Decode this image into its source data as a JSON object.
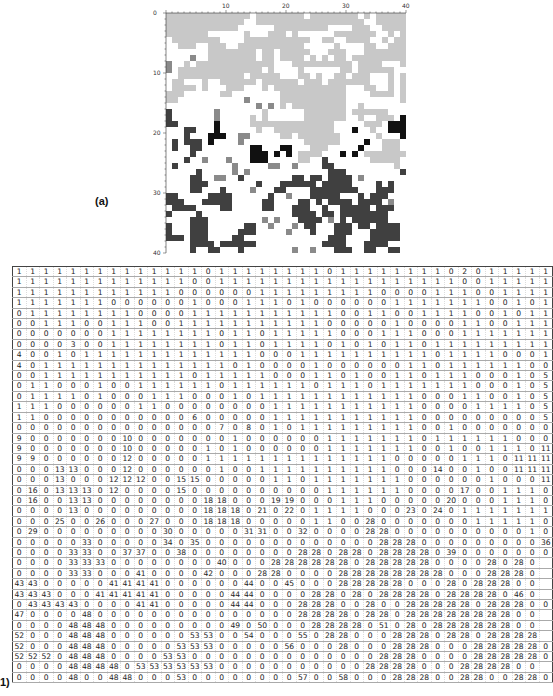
{
  "figure_a": {
    "label": "(a)",
    "grid_size": 40,
    "x_ticks": [
      "10",
      "20",
      "30",
      "40"
    ],
    "y_ticks": [
      "0",
      "10",
      "20",
      "30",
      "40"
    ],
    "colors": {
      "background": "#ffffff",
      "light_gray": "#c8c8c8",
      "mid_gray": "#8a8a8a",
      "dark_gray": "#404040",
      "black": "#111111"
    }
  },
  "figure_b": {
    "label": "1)",
    "rows": [
      [
        1,
        1,
        1,
        1,
        1,
        1,
        1,
        1,
        1,
        1,
        1,
        1,
        1,
        1,
        0,
        1,
        1,
        1,
        1,
        1,
        1,
        1,
        1,
        0,
        1,
        1,
        1,
        1,
        1,
        1,
        1,
        1,
        0,
        2,
        0,
        1,
        1,
        1,
        1,
        1
      ],
      [
        1,
        1,
        1,
        1,
        1,
        1,
        1,
        1,
        1,
        1,
        1,
        1,
        1,
        0,
        0,
        1,
        1,
        1,
        1,
        1,
        1,
        1,
        1,
        1,
        1,
        1,
        1,
        1,
        1,
        1,
        1,
        1,
        1,
        0,
        0,
        1,
        1,
        1,
        1,
        1
      ],
      [
        1,
        1,
        1,
        1,
        1,
        1,
        1,
        1,
        1,
        1,
        1,
        1,
        0,
        0,
        0,
        0,
        0,
        0,
        1,
        1,
        1,
        1,
        1,
        1,
        1,
        1,
        1,
        0,
        0,
        0,
        0,
        1,
        1,
        1,
        0,
        0,
        1,
        1,
        1,
        1
      ],
      [
        1,
        1,
        1,
        1,
        1,
        1,
        1,
        0,
        0,
        0,
        0,
        0,
        0,
        1,
        0,
        0,
        0,
        1,
        1,
        1,
        0,
        1,
        0,
        0,
        0,
        0,
        0,
        0,
        1,
        1,
        1,
        1,
        1,
        1,
        1,
        0,
        0,
        1,
        0,
        1
      ],
      [
        0,
        1,
        1,
        1,
        1,
        1,
        1,
        1,
        1,
        0,
        0,
        0,
        0,
        1,
        1,
        1,
        1,
        1,
        1,
        1,
        1,
        1,
        1,
        1,
        0,
        0,
        1,
        1,
        0,
        0,
        1,
        1,
        1,
        1,
        0,
        0,
        1,
        0,
        1,
        1
      ],
      [
        0,
        0,
        1,
        1,
        1,
        0,
        0,
        1,
        1,
        1,
        0,
        0,
        1,
        1,
        1,
        1,
        1,
        1,
        1,
        1,
        1,
        1,
        1,
        0,
        0,
        0,
        0,
        0,
        1,
        0,
        0,
        0,
        0,
        1,
        1,
        0,
        0,
        1,
        1,
        1
      ],
      [
        0,
        0,
        0,
        0,
        0,
        0,
        0,
        1,
        1,
        1,
        1,
        1,
        1,
        1,
        1,
        0,
        1,
        1,
        0,
        1,
        1,
        1,
        1,
        1,
        0,
        0,
        0,
        1,
        1,
        1,
        0,
        0,
        0,
        1,
        1,
        1,
        1,
        1,
        1,
        1
      ],
      [
        0,
        0,
        0,
        0,
        3,
        0,
        0,
        1,
        1,
        1,
        1,
        1,
        1,
        1,
        1,
        0,
        1,
        1,
        0,
        1,
        1,
        1,
        1,
        0,
        1,
        0,
        1,
        0,
        1,
        1,
        0,
        1,
        1,
        1,
        1,
        1,
        1,
        1,
        1,
        1
      ],
      [
        4,
        0,
        0,
        1,
        0,
        1,
        1,
        1,
        1,
        1,
        1,
        1,
        1,
        1,
        1,
        1,
        1,
        1,
        0,
        0,
        0,
        1,
        1,
        1,
        1,
        1,
        1,
        1,
        1,
        1,
        1,
        0,
        1,
        1,
        1,
        1,
        0,
        0,
        0,
        1
      ],
      [
        4,
        0,
        1,
        1,
        1,
        1,
        1,
        1,
        1,
        1,
        1,
        1,
        1,
        1,
        1,
        1,
        0,
        1,
        0,
        0,
        0,
        0,
        1,
        0,
        0,
        0,
        0,
        0,
        0,
        1,
        1,
        0,
        1,
        1,
        1,
        1,
        1,
        1,
        0,
        0
      ],
      [
        0,
        0,
        1,
        1,
        1,
        1,
        1,
        1,
        1,
        1,
        1,
        1,
        1,
        0,
        1,
        1,
        1,
        1,
        1,
        0,
        0,
        0,
        1,
        1,
        0,
        1,
        0,
        0,
        1,
        1,
        0,
        1,
        1,
        1,
        0,
        0,
        0,
        1,
        0,
        5
      ],
      [
        0,
        1,
        1,
        0,
        0,
        0,
        1,
        0,
        0,
        1,
        1,
        1,
        1,
        1,
        1,
        0,
        1,
        1,
        1,
        1,
        1,
        1,
        0,
        1,
        1,
        1,
        0,
        1,
        1,
        1,
        1,
        1,
        1,
        1,
        0,
        0,
        0,
        1,
        0,
        5
      ],
      [
        0,
        1,
        1,
        1,
        1,
        0,
        1,
        0,
        0,
        0,
        1,
        1,
        1,
        0,
        0,
        0,
        1,
        0,
        1,
        1,
        1,
        1,
        1,
        1,
        1,
        1,
        1,
        1,
        1,
        1,
        0,
        0,
        0,
        1,
        1,
        0,
        0,
        1,
        0,
        5
      ],
      [
        1,
        1,
        1,
        0,
        0,
        0,
        0,
        0,
        0,
        1,
        1,
        0,
        0,
        0,
        0,
        0,
        0,
        0,
        0,
        1,
        1,
        1,
        1,
        1,
        1,
        1,
        1,
        1,
        1,
        1,
        0,
        0,
        0,
        0,
        1,
        1,
        1,
        1,
        0,
        5
      ],
      [
        1,
        1,
        0,
        0,
        0,
        0,
        0,
        0,
        0,
        0,
        0,
        0,
        0,
        6,
        0,
        0,
        0,
        0,
        0,
        1,
        1,
        1,
        1,
        1,
        1,
        1,
        1,
        1,
        1,
        1,
        0,
        0,
        0,
        0,
        0,
        0,
        0,
        0,
        0,
        5
      ],
      [
        0,
        0,
        0,
        0,
        0,
        0,
        0,
        0,
        0,
        0,
        0,
        0,
        0,
        0,
        0,
        7,
        0,
        8,
        0,
        1,
        0,
        1,
        1,
        1,
        1,
        1,
        1,
        1,
        1,
        1,
        0,
        0,
        1,
        0,
        0,
        0,
        0,
        0,
        0,
        0
      ],
      [
        9,
        0,
        0,
        0,
        0,
        0,
        0,
        0,
        10,
        0,
        0,
        0,
        0,
        0,
        0,
        0,
        1,
        0,
        0,
        0,
        0,
        0,
        0,
        1,
        1,
        1,
        1,
        1,
        1,
        1,
        0,
        1,
        1,
        1,
        1,
        1,
        1,
        0,
        0,
        0,
        11,
        11
      ],
      [
        9,
        0,
        0,
        0,
        0,
        0,
        0,
        0,
        10,
        0,
        0,
        0,
        0,
        0,
        1,
        0,
        1,
        0,
        0,
        0,
        0,
        0,
        0,
        1,
        1,
        1,
        1,
        1,
        1,
        1,
        0,
        0,
        1,
        0,
        0,
        1,
        1,
        1,
        0,
        11
      ],
      [
        9,
        9,
        0,
        0,
        0,
        0,
        0,
        0,
        12,
        0,
        0,
        0,
        0,
        0,
        1,
        1,
        1,
        1,
        1,
        1,
        1,
        1,
        1,
        1,
        1,
        1,
        1,
        1,
        0,
        0,
        0,
        0,
        0,
        1,
        1,
        1,
        0,
        11,
        11,
        11
      ],
      [
        0,
        0,
        0,
        13,
        13,
        0,
        0,
        0,
        12,
        0,
        0,
        0,
        0,
        0,
        0,
        1,
        0,
        0,
        1,
        1,
        1,
        1,
        1,
        1,
        1,
        1,
        1,
        1,
        0,
        0,
        0,
        14,
        0,
        0,
        1,
        0,
        0,
        11,
        11,
        11
      ],
      [
        0,
        0,
        0,
        13,
        0,
        0,
        0,
        12,
        12,
        12,
        0,
        0,
        15,
        15,
        0,
        0,
        0,
        0,
        0,
        1,
        1,
        0,
        1,
        1,
        1,
        1,
        1,
        1,
        1,
        0,
        0,
        0,
        0,
        0,
        0,
        1,
        0,
        0,
        0,
        11
      ],
      [
        0,
        16,
        0,
        13,
        13,
        13,
        0,
        12,
        0,
        0,
        0,
        0,
        15,
        0,
        0,
        0,
        0,
        0,
        0,
        0,
        0,
        0,
        0,
        1,
        1,
        1,
        1,
        1,
        1,
        0,
        0,
        0,
        0,
        17,
        0,
        0,
        1,
        1,
        1,
        0
      ],
      [
        0,
        16,
        0,
        0,
        13,
        13,
        0,
        0,
        0,
        0,
        0,
        0,
        0,
        0,
        18,
        18,
        0,
        0,
        0,
        19,
        19,
        0,
        0,
        0,
        1,
        1,
        1,
        0,
        0,
        0,
        0,
        0,
        20,
        0,
        0,
        0,
        1,
        1,
        1,
        0
      ],
      [
        0,
        0,
        0,
        0,
        13,
        0,
        0,
        0,
        0,
        0,
        0,
        0,
        0,
        0,
        18,
        18,
        18,
        0,
        21,
        0,
        22,
        0,
        1,
        1,
        1,
        1,
        0,
        0,
        0,
        23,
        0,
        24,
        0,
        1,
        1,
        1,
        1,
        1,
        1,
        1
      ],
      [
        0,
        0,
        0,
        25,
        0,
        0,
        26,
        0,
        0,
        0,
        27,
        0,
        0,
        0,
        18,
        18,
        18,
        0,
        0,
        0,
        0,
        0,
        1,
        1,
        0,
        0,
        28,
        0,
        0,
        0,
        0,
        0,
        0,
        0,
        1,
        1,
        1,
        1,
        1,
        0
      ],
      [
        0,
        29,
        0,
        0,
        0,
        0,
        0,
        0,
        0,
        0,
        0,
        30,
        0,
        0,
        0,
        0,
        0,
        31,
        31,
        0,
        0,
        32,
        0,
        0,
        0,
        0,
        28,
        28,
        0,
        0,
        0,
        0,
        0,
        0,
        0,
        0,
        0,
        0,
        1,
        0
      ],
      [
        0,
        0,
        0,
        0,
        0,
        33,
        0,
        0,
        0,
        0,
        0,
        34,
        0,
        35,
        0,
        0,
        0,
        0,
        0,
        0,
        0,
        0,
        0,
        0,
        0,
        0,
        0,
        28,
        28,
        28,
        0,
        0,
        0,
        0,
        0,
        0,
        0,
        0,
        0,
        36
      ],
      [
        0,
        0,
        0,
        0,
        33,
        33,
        0,
        0,
        37,
        37,
        0,
        0,
        38,
        0,
        0,
        0,
        0,
        0,
        0,
        0,
        0,
        28,
        28,
        0,
        28,
        28,
        0,
        28,
        28,
        28,
        28,
        0,
        39,
        0,
        0,
        0,
        0,
        0,
        0,
        0
      ],
      [
        0,
        0,
        0,
        0,
        33,
        33,
        33,
        0,
        0,
        0,
        0,
        0,
        0,
        0,
        0,
        40,
        0,
        0,
        0,
        28,
        28,
        28,
        28,
        28,
        28,
        0,
        28,
        28,
        28,
        28,
        28,
        0,
        0,
        0,
        0,
        28,
        0,
        28,
        0
      ],
      [
        0,
        0,
        0,
        0,
        33,
        33,
        0,
        0,
        0,
        41,
        0,
        0,
        0,
        0,
        42,
        0,
        0,
        0,
        28,
        28,
        0,
        0,
        0,
        0,
        28,
        28,
        28,
        28,
        28,
        28,
        28,
        28,
        0,
        0,
        0,
        28,
        28,
        28,
        0
      ],
      [
        43,
        43,
        0,
        0,
        0,
        0,
        0,
        41,
        41,
        41,
        41,
        0,
        0,
        0,
        0,
        0,
        0,
        44,
        0,
        0,
        45,
        0,
        0,
        0,
        28,
        28,
        28,
        28,
        28,
        0,
        0,
        0,
        28,
        0,
        28,
        28,
        28,
        0,
        0
      ],
      [
        43,
        43,
        43,
        0,
        0,
        0,
        41,
        41,
        41,
        41,
        41,
        0,
        0,
        0,
        0,
        0,
        44,
        44,
        0,
        0,
        0,
        0,
        28,
        28,
        0,
        28,
        0,
        28,
        28,
        28,
        28,
        0,
        28,
        28,
        28,
        28,
        0,
        46,
        0
      ],
      [
        0,
        43,
        43,
        43,
        43,
        0,
        0,
        0,
        0,
        41,
        41,
        0,
        0,
        0,
        0,
        0,
        44,
        44,
        0,
        0,
        0,
        28,
        28,
        28,
        0,
        0,
        28,
        0,
        0,
        28,
        28,
        28,
        28,
        28,
        0,
        28,
        28,
        28,
        0,
        0
      ],
      [
        47,
        0,
        0,
        0,
        0,
        48,
        0,
        0,
        0,
        0,
        0,
        0,
        0,
        0,
        0,
        0,
        0,
        0,
        0,
        0,
        0,
        28,
        28,
        28,
        28,
        0,
        28,
        28,
        0,
        28,
        28,
        28,
        28,
        28,
        28,
        28,
        28,
        0,
        0
      ],
      [
        0,
        0,
        0,
        0,
        48,
        48,
        48,
        0,
        0,
        0,
        0,
        0,
        0,
        0,
        0,
        0,
        49,
        0,
        50,
        0,
        0,
        0,
        28,
        28,
        28,
        28,
        0,
        51,
        0,
        28,
        0,
        28,
        28,
        28,
        28,
        28,
        28,
        0,
        0
      ],
      [
        52,
        0,
        0,
        0,
        48,
        48,
        48,
        0,
        0,
        0,
        0,
        0,
        0,
        53,
        53,
        0,
        0,
        54,
        0,
        0,
        0,
        55,
        0,
        28,
        28,
        0,
        0,
        0,
        28,
        28,
        28,
        0,
        28,
        28,
        0,
        28,
        28,
        28,
        28
      ],
      [
        52,
        0,
        0,
        0,
        48,
        48,
        48,
        0,
        0,
        0,
        0,
        0,
        53,
        53,
        53,
        0,
        0,
        0,
        0,
        0,
        56,
        0,
        0,
        0,
        28,
        0,
        0,
        0,
        28,
        28,
        28,
        0,
        0,
        0,
        28,
        28,
        28,
        28,
        28,
        0
      ],
      [
        52,
        52,
        52,
        0,
        48,
        48,
        48,
        0,
        0,
        0,
        0,
        53,
        53,
        0,
        0,
        0,
        0,
        0,
        0,
        0,
        0,
        0,
        0,
        0,
        0,
        0,
        0,
        28,
        28,
        28,
        0,
        0,
        0,
        0,
        28,
        28,
        28,
        28,
        28,
        0
      ],
      [
        0,
        0,
        0,
        0,
        48,
        48,
        48,
        48,
        0,
        53,
        53,
        53,
        53,
        53,
        53,
        0,
        0,
        0,
        0,
        0,
        0,
        0,
        0,
        0,
        0,
        0,
        28,
        28,
        28,
        28,
        0,
        0,
        0,
        28,
        28,
        28,
        28,
        0,
        0
      ],
      [
        0,
        0,
        0,
        0,
        48,
        0,
        0,
        48,
        48,
        0,
        0,
        0,
        53,
        0,
        0,
        0,
        0,
        0,
        0,
        0,
        0,
        57,
        0,
        0,
        58,
        0,
        0,
        0,
        28,
        28,
        28,
        0,
        0,
        28,
        28,
        0,
        0,
        28,
        28,
        0
      ]
    ]
  }
}
